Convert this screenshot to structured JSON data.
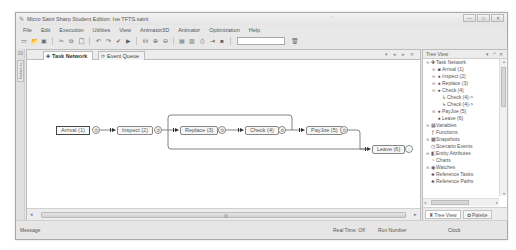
{
  "window": {
    "title": "Micro Saint Sharp Student Edition: Ive TFTS.saint",
    "title_mark": "'",
    "controls": [
      "—",
      "□",
      "✕"
    ]
  },
  "menubar": {
    "items": [
      "File",
      "Edit",
      "Execution",
      "Utilities",
      "View",
      "Animator3D",
      "Animator",
      "Optimization",
      "Help"
    ]
  },
  "toolbar": {
    "buttons": [
      {
        "name": "new-icon",
        "glyph": "▭"
      },
      {
        "name": "open-icon",
        "glyph": "📂"
      },
      {
        "name": "save-icon",
        "glyph": "▣"
      },
      {
        "name": "cut-icon",
        "glyph": "✂"
      },
      {
        "name": "copy-icon",
        "glyph": "⧉"
      },
      {
        "name": "paste-icon",
        "glyph": "📋"
      },
      {
        "name": "undo-icon",
        "glyph": "↶"
      },
      {
        "name": "redo-icon",
        "glyph": "↷"
      },
      {
        "name": "check-icon",
        "glyph": "✔"
      },
      {
        "name": "play-icon",
        "glyph": "▶"
      },
      {
        "name": "find-icon",
        "glyph": "⛁"
      },
      {
        "name": "zoom-in-icon",
        "glyph": "⊕"
      },
      {
        "name": "zoom-out-icon",
        "glyph": "⊖"
      },
      {
        "name": "grid-icon",
        "glyph": "▤"
      },
      {
        "name": "layout-icon",
        "glyph": "▥"
      },
      {
        "name": "print-icon",
        "glyph": "⎙"
      },
      {
        "name": "export-icon",
        "glyph": "⇥"
      },
      {
        "name": "stop-icon",
        "glyph": "■"
      }
    ],
    "search_value": "",
    "trash_glyph": "🗑"
  },
  "left_strip": {
    "pin_glyph": "⊡",
    "vertical_tab_label": "Networks"
  },
  "doc_tabs": {
    "tabs": [
      {
        "label": "Task Network",
        "icon": "✤",
        "active": true
      },
      {
        "label": "Event Queue",
        "icon": "⟳",
        "active": false
      }
    ],
    "controls": "▾ ◂ ▸ ✕"
  },
  "network": {
    "nodes": [
      {
        "id": 1,
        "label": "Arrival (1)",
        "type": "start"
      },
      {
        "id": 2,
        "label": "Inspect (2)",
        "type": "task"
      },
      {
        "id": 3,
        "label": "Replace (3)",
        "type": "task"
      },
      {
        "id": 4,
        "label": "Check (4)",
        "type": "task"
      },
      {
        "id": 5,
        "label": "PayJoe (5)",
        "type": "task"
      },
      {
        "id": 6,
        "label": "Leave (6)",
        "type": "task"
      }
    ]
  },
  "doc_scroll": {
    "left_arrow": "◂",
    "right_arrow": "▸",
    "grip": "▥"
  },
  "tree_view": {
    "title": "Tree View",
    "controls": "▾ ꟸ ✕",
    "items": [
      {
        "label": "Task Network",
        "indent": 0,
        "exp": "⊟",
        "icon": "✤"
      },
      {
        "label": "Arrival (1)",
        "indent": 1,
        "exp": "⊞",
        "icon": "■"
      },
      {
        "label": "Inspect (2)",
        "indent": 1,
        "exp": "⊞",
        "icon": "●"
      },
      {
        "label": "Replace (3)",
        "indent": 1,
        "exp": "⊞",
        "icon": "●"
      },
      {
        "label": "Check (4)",
        "indent": 1,
        "exp": "⊟",
        "icon": "●"
      },
      {
        "label": "Check (4)->",
        "indent": 2,
        "exp": "",
        "icon": "↳"
      },
      {
        "label": "Check (4)->",
        "indent": 2,
        "exp": "",
        "icon": "↳"
      },
      {
        "label": "PayJoe (5)",
        "indent": 1,
        "exp": "⊞",
        "icon": "●"
      },
      {
        "label": "Leave (6)",
        "indent": 1,
        "exp": "",
        "icon": "●"
      },
      {
        "label": "Variables",
        "indent": 0,
        "exp": "⊞",
        "icon": "▦"
      },
      {
        "label": "Functions",
        "indent": 0,
        "exp": "",
        "icon": "ƒ"
      },
      {
        "label": "Snapshots",
        "indent": 0,
        "exp": "⊞",
        "icon": "▩"
      },
      {
        "label": "Scenario Events",
        "indent": 0,
        "exp": "",
        "icon": "◷"
      },
      {
        "label": "Entity Attributes",
        "indent": 0,
        "exp": "⊞",
        "icon": "◧"
      },
      {
        "label": "Charts",
        "indent": 0,
        "exp": "",
        "icon": "◔"
      },
      {
        "label": "Watches",
        "indent": 0,
        "exp": "⊞",
        "icon": "◉"
      },
      {
        "label": "Reference Tasks",
        "indent": 0,
        "exp": "",
        "icon": "♣"
      },
      {
        "label": "Reference Paths",
        "indent": 0,
        "exp": "",
        "icon": "♣"
      }
    ],
    "tabs": [
      {
        "label": "Tree View",
        "icon": "♜",
        "active": true
      },
      {
        "label": "Palette",
        "icon": "✿",
        "active": false
      }
    ]
  },
  "statusbar": {
    "message": "Message",
    "real_time": "Real Time: Off",
    "run_number": "Run Number",
    "clock": "Clock"
  }
}
